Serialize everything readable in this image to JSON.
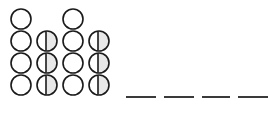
{
  "page": {
    "kind": "math-worksheet-fragment",
    "background_color": "#ffffff",
    "width": 268,
    "height": 114
  },
  "counters": {
    "shape": "circle",
    "outline_color": "#1a1a1a",
    "fill_empty_color": "#ffffff",
    "fill_half_color": "#e8e8e8",
    "divider_color": "#1a1a1a",
    "diameter": 22,
    "columns": 4,
    "rows": 4,
    "column_x": [
      10,
      36,
      62,
      88
    ],
    "row_y": [
      8,
      30,
      52,
      74
    ],
    "states": {
      "empty": "empty-circle",
      "split": "split-circle",
      "none": "no-counter"
    },
    "grid": [
      [
        "empty",
        "none",
        "empty",
        "none"
      ],
      [
        "empty",
        "split",
        "empty",
        "split"
      ],
      [
        "empty",
        "split",
        "empty",
        "split"
      ],
      [
        "empty",
        "split",
        "empty",
        "split"
      ]
    ],
    "counts": {
      "empty_total": 8,
      "split_total": 6,
      "blank_total": 2,
      "visible_total": 14
    }
  },
  "answer_blanks": {
    "color": "#3a3a3a",
    "thickness": 2,
    "count": 4,
    "items": [
      {
        "label": "blank-1",
        "left": 0,
        "width": 30
      },
      {
        "label": "blank-2",
        "left": 38,
        "width": 30
      },
      {
        "label": "blank-3",
        "left": 76,
        "width": 28
      },
      {
        "label": "blank-4",
        "left": 112,
        "width": 30
      }
    ]
  },
  "chart_data": {
    "type": "table",
    "title": "",
    "categories": [
      "column-1",
      "column-2",
      "column-3",
      "column-4"
    ],
    "row_labels": [
      "row-1",
      "row-2",
      "row-3",
      "row-4"
    ],
    "series": [
      {
        "name": "row-1",
        "values": [
          "empty",
          "none",
          "empty",
          "none"
        ]
      },
      {
        "name": "row-2",
        "values": [
          "empty",
          "split",
          "empty",
          "split"
        ]
      },
      {
        "name": "row-3",
        "values": [
          "empty",
          "split",
          "empty",
          "split"
        ]
      },
      {
        "name": "row-4",
        "values": [
          "empty",
          "split",
          "empty",
          "split"
        ]
      }
    ],
    "xlabel": "",
    "ylabel": "",
    "legend": [
      "empty-circle",
      "split-circle"
    ],
    "grid": false
  }
}
